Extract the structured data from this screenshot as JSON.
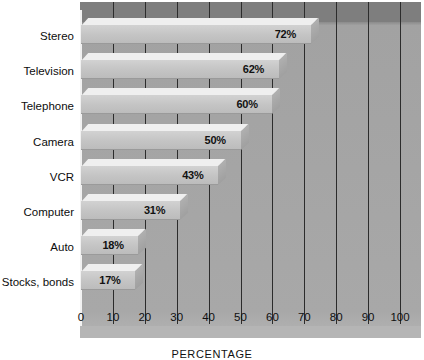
{
  "chart_data": {
    "type": "bar",
    "orientation": "horizontal",
    "title": "",
    "xlabel": "PERCENTAGE",
    "ylabel": "",
    "xlim": [
      0,
      100
    ],
    "grid": true,
    "legend": "none",
    "categories": [
      "Stereo",
      "Television",
      "Telephone",
      "Camera",
      "VCR",
      "Computer",
      "Auto",
      "Stocks, bonds"
    ],
    "values": [
      72,
      62,
      60,
      50,
      43,
      31,
      18,
      17
    ],
    "value_labels": [
      "72%",
      "62%",
      "60%",
      "50%",
      "43%",
      "31%",
      "18%",
      "17%"
    ],
    "xticks": [
      0,
      10,
      20,
      30,
      40,
      50,
      60,
      70,
      80,
      90,
      100
    ],
    "xtick_labels": [
      "0",
      "10",
      "20",
      "30",
      "40",
      "50",
      "60",
      "70",
      "80",
      "90",
      "100"
    ]
  },
  "style": {
    "plot_background": "#a6a6a6",
    "plot_top_band": "#7e7e7e",
    "bar_face": "#c4c4c4",
    "bar_top": "#efefef",
    "bar_side": "#a8a8a8",
    "gridline": "#2c2c2c",
    "text": "#101010"
  }
}
